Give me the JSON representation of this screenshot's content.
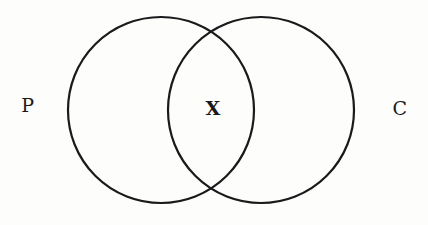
{
  "figure": {
    "type": "venn-diagram",
    "background_color": "#fdfdfc",
    "stroke_color": "#1a1a1c",
    "text_color": "#19191b",
    "stroke_width": 2.2,
    "width": 428,
    "height": 225
  },
  "chart_data": {
    "type": "diagram",
    "subtype": "venn-2-set",
    "title": "",
    "sets": [
      {
        "id": "left",
        "label": "P",
        "label_position": "outside-left",
        "center": [
          161,
          110
        ],
        "radius": 93
      },
      {
        "id": "right",
        "label": "C",
        "label_position": "outside-right",
        "center": [
          261,
          110
        ],
        "radius": 93
      }
    ],
    "regions": [
      {
        "id": "left-only",
        "label": "",
        "sets": [
          "left"
        ]
      },
      {
        "id": "intersection",
        "label": "X",
        "sets": [
          "left",
          "right"
        ],
        "center": [
          213,
          110
        ]
      },
      {
        "id": "right-only",
        "label": "",
        "sets": [
          "right"
        ]
      }
    ],
    "legend": "none",
    "grid": false
  },
  "labels": {
    "left_set": "P",
    "right_set": "C",
    "intersection": "X"
  }
}
